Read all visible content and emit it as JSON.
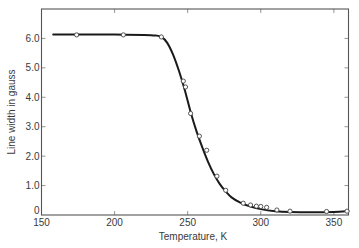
{
  "chart_data": {
    "type": "line",
    "title": "",
    "xlabel": "Temperature, K",
    "ylabel": "Line width in gauss",
    "xlim": [
      150,
      360
    ],
    "ylim": [
      0,
      7
    ],
    "grid": false,
    "legend": null,
    "x_ticks": [
      150,
      200,
      250,
      300,
      350
    ],
    "x_tick_labels": [
      "150",
      "200",
      "250",
      "300",
      "350"
    ],
    "y_ticks": [
      0,
      1,
      2,
      3,
      4,
      5,
      6
    ],
    "y_tick_labels": [
      "0",
      "1.0",
      "2.0",
      "3.0",
      "4.0",
      "5.0",
      "6.0"
    ],
    "series": [
      {
        "name": "measured",
        "style": "open-circle markers",
        "x": [
          174,
          206,
          232,
          247,
          248.5,
          252,
          258,
          263,
          270,
          276,
          288,
          293,
          297,
          300,
          304,
          311,
          320,
          345,
          359
        ],
        "y": [
          6.12,
          6.12,
          6.05,
          4.55,
          4.35,
          3.45,
          2.68,
          2.2,
          1.32,
          0.84,
          0.4,
          0.34,
          0.3,
          0.29,
          0.26,
          0.17,
          0.13,
          0.12,
          0.13
        ]
      },
      {
        "name": "fitted curve",
        "style": "solid line",
        "x": [
          158,
          180,
          200,
          220,
          228,
          232,
          236,
          240,
          244,
          248,
          252,
          256,
          260,
          264,
          268,
          272,
          276,
          280,
          286,
          292,
          300,
          310,
          320,
          335,
          350,
          360
        ],
        "y": [
          6.13,
          6.13,
          6.13,
          6.12,
          6.1,
          6.05,
          5.85,
          5.45,
          4.9,
          4.25,
          3.5,
          2.85,
          2.3,
          1.8,
          1.38,
          1.05,
          0.8,
          0.6,
          0.42,
          0.3,
          0.2,
          0.13,
          0.1,
          0.09,
          0.1,
          0.13
        ]
      }
    ]
  }
}
